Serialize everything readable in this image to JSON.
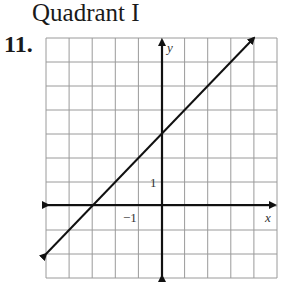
{
  "header": {
    "title": "Quadrant I"
  },
  "problem": {
    "number": "11."
  },
  "chart_data": {
    "type": "line",
    "title": "",
    "xlabel": "x",
    "ylabel": "y",
    "xlim": [
      -5,
      5
    ],
    "ylim": [
      -3,
      7
    ],
    "grid": true,
    "tick_labels": {
      "x": "-1",
      "y": "1"
    },
    "series": [
      {
        "name": "line",
        "equation": "y = x + 3",
        "x": [
          -5,
          -3,
          0,
          4
        ],
        "y": [
          -2,
          0,
          3,
          7
        ]
      }
    ]
  },
  "labels": {
    "x_axis": "x",
    "y_axis": "y",
    "x_tick": "−1",
    "y_tick": "1"
  }
}
